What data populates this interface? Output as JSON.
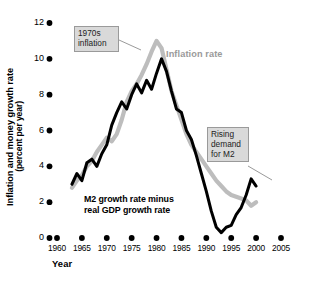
{
  "chart_data": {
    "type": "line",
    "title": "",
    "xlabel": "Year",
    "ylabel": "Inflation and money growth rate (percent per year)",
    "ylabel_line1": "Inflation and money growth rate",
    "ylabel_line2": "(percent per year)",
    "xlim": [
      1958,
      2006
    ],
    "ylim": [
      0,
      12
    ],
    "grid": false,
    "legend_position": "inline-annotations",
    "xticks": [
      1960,
      1965,
      1970,
      1975,
      1980,
      1985,
      1990,
      1995,
      2000,
      2005
    ],
    "xtick_labels": [
      "1960",
      "1965",
      "1970",
      "1975",
      "1980",
      "1985",
      "1990",
      "1995",
      "2000",
      "2005"
    ],
    "yticks": [
      0,
      2,
      4,
      6,
      8,
      10,
      12
    ],
    "ytick_labels": [
      "0",
      "2",
      "4",
      "6",
      "8",
      "10",
      "12"
    ],
    "tick_marker_style": "filled-dot",
    "colors": {
      "inflation_rate": "#bdbdbd",
      "m2_minus_gdp": "#000000",
      "callout_box_fill": "#d9d9d9",
      "callout_box_border": "#9a9a9a",
      "axis_text": "#000000"
    },
    "series": [
      {
        "name": "Inflation rate",
        "color": "#bdbdbd",
        "x": [
          1963,
          1964,
          1965,
          1966,
          1967,
          1968,
          1969,
          1970,
          1971,
          1972,
          1973,
          1974,
          1975,
          1976,
          1977,
          1978,
          1979,
          1980,
          1981,
          1982,
          1983,
          1984,
          1985,
          1986,
          1987,
          1988,
          1989,
          1990,
          1991,
          1992,
          1993,
          1994,
          1995,
          1996,
          1997,
          1998,
          1999,
          2000
        ],
        "values": [
          2.8,
          3.2,
          3.5,
          4.0,
          4.3,
          4.8,
          5.2,
          5.6,
          5.4,
          5.8,
          6.6,
          7.6,
          8.2,
          8.6,
          9.1,
          9.7,
          10.4,
          11.0,
          10.6,
          9.4,
          8.2,
          7.4,
          6.6,
          5.8,
          5.2,
          4.8,
          4.4,
          4.0,
          3.6,
          3.2,
          2.9,
          2.6,
          2.4,
          2.3,
          2.2,
          2.1,
          1.8,
          2.0
        ]
      },
      {
        "name": "M2 growth rate minus real GDP growth rate",
        "color": "#000000",
        "x": [
          1963,
          1964,
          1965,
          1966,
          1967,
          1968,
          1969,
          1970,
          1971,
          1972,
          1973,
          1974,
          1975,
          1976,
          1977,
          1978,
          1979,
          1980,
          1981,
          1982,
          1983,
          1984,
          1985,
          1986,
          1987,
          1988,
          1989,
          1990,
          1991,
          1992,
          1993,
          1994,
          1995,
          1996,
          1997,
          1998,
          1999,
          2000
        ],
        "values": [
          3.0,
          3.6,
          3.2,
          4.2,
          4.4,
          4.0,
          4.7,
          5.2,
          6.3,
          7.0,
          7.6,
          7.2,
          8.0,
          8.6,
          8.1,
          8.8,
          8.3,
          9.2,
          10.0,
          9.3,
          8.2,
          7.2,
          7.0,
          6.0,
          5.5,
          4.6,
          3.6,
          2.6,
          1.5,
          0.6,
          0.3,
          0.6,
          0.7,
          1.3,
          1.7,
          2.4,
          3.3,
          2.9
        ]
      }
    ],
    "annotations": [
      {
        "id": "1970s-inflation",
        "text_lines": [
          "1970s",
          "inflation"
        ],
        "text": "1970s inflation",
        "points_to": "inflation_rate_peak"
      },
      {
        "id": "rising-demand-for-m2",
        "text_lines": [
          "Rising",
          "demand",
          "for M2"
        ],
        "text": "Rising demand for M2",
        "points_to": "m2_minus_gdp_late_rise"
      },
      {
        "id": "inflation-rate-label",
        "text": "Inflation rate",
        "color": "#9a9a9a"
      },
      {
        "id": "m2-minus-gdp-label",
        "text_lines": [
          "M2 growth rate minus",
          "real GDP growth rate"
        ],
        "text": "M2 growth rate minus real GDP growth rate",
        "color": "#000000"
      }
    ]
  },
  "axis": {
    "x_title": "Year",
    "y_title_line1": "Inflation and money growth rate",
    "y_title_line2": "(percent per year)"
  },
  "labels": {
    "inflation_rate": "Inflation rate",
    "m2_line1": "M2 growth rate minus",
    "m2_line2": "real GDP growth rate",
    "callout_1970s_line1": "1970s",
    "callout_1970s_line2": "inflation",
    "callout_m2_line1": "Rising",
    "callout_m2_line2": "demand",
    "callout_m2_line3": "for M2"
  }
}
